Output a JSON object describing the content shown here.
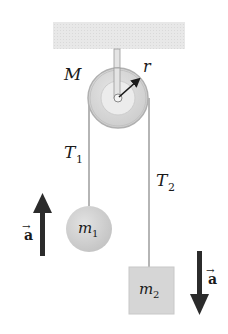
{
  "diagram": {
    "type": "atwood-machine",
    "labels": {
      "pulley_mass": "M",
      "pulley_radius": "r",
      "tension_left": {
        "symbol": "T",
        "subscript": "1"
      },
      "tension_right": {
        "symbol": "T",
        "subscript": "2"
      },
      "mass_left": {
        "symbol": "m",
        "subscript": "1"
      },
      "mass_right": {
        "symbol": "m",
        "subscript": "2"
      },
      "accel_left": "a",
      "accel_right": "a",
      "vector_mark": "→"
    },
    "directions": {
      "accel_left": "up",
      "accel_right": "down"
    },
    "colors": {
      "ceiling": "#e6e6e6",
      "pulley_outer": "#d4d4d4",
      "pulley_inner": "#e9e9e9",
      "rope": "#b8b8b8",
      "mass_left": "#cfcfcf",
      "mass_right": "#d6d6d6",
      "arrow": "#2b2b2b"
    }
  }
}
